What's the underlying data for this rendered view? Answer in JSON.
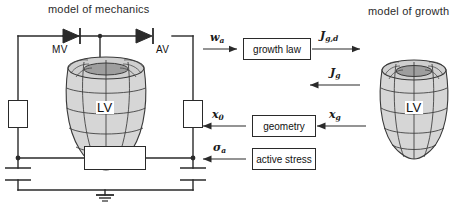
{
  "figure": {
    "type": "block-diagram"
  },
  "headings": {
    "left": "model of mechanics",
    "right": "model of growth"
  },
  "circuit": {
    "valves": [
      {
        "name": "mitral-valve",
        "label": "MV"
      },
      {
        "name": "aortic-valve",
        "label": "AV"
      }
    ],
    "ventricle_label": "LV",
    "elements": [
      {
        "name": "left-resistor",
        "label": ""
      },
      {
        "name": "right-resistor",
        "label": ""
      },
      {
        "name": "bottom-resistor",
        "label": ""
      },
      {
        "name": "left-capacitor",
        "label": ""
      },
      {
        "name": "right-capacitor",
        "label": ""
      },
      {
        "name": "ground",
        "label": ""
      }
    ]
  },
  "blocks": [
    {
      "id": "growth-law",
      "label": "growth law"
    },
    {
      "id": "geometry",
      "label": "geometry"
    },
    {
      "id": "active-stress",
      "label": "active stress"
    }
  ],
  "signals": [
    {
      "id": "w-a",
      "base": "w",
      "sub": "a",
      "direction": "right",
      "from": "model of mechanics",
      "to": "growth law"
    },
    {
      "id": "J-g-d",
      "base": "J",
      "sub": "g,d",
      "direction": "right",
      "from": "growth law",
      "to": "model of growth"
    },
    {
      "id": "J-g",
      "base": "J",
      "sub": "g",
      "direction": "left",
      "from": "model of growth",
      "to": "growth law"
    },
    {
      "id": "x-0",
      "base": "x",
      "sub": "0",
      "direction": "left",
      "from": "geometry",
      "to": "model of mechanics"
    },
    {
      "id": "x-g",
      "base": "x",
      "sub": "g",
      "direction": "left",
      "from": "model of growth",
      "to": "geometry"
    },
    {
      "id": "sigma-a",
      "base": "σ",
      "sub": "a",
      "direction": "left",
      "from": "active stress",
      "to": "model of mechanics"
    }
  ],
  "growth_model": {
    "ventricle_label": "LV"
  },
  "colors": {
    "line": "#2a2a2a",
    "mesh": "#3a3a3a",
    "lv_fill": "#d6d6d6",
    "lv_fill_dark": "#b9b9b9",
    "text": "#1a1a1a"
  }
}
